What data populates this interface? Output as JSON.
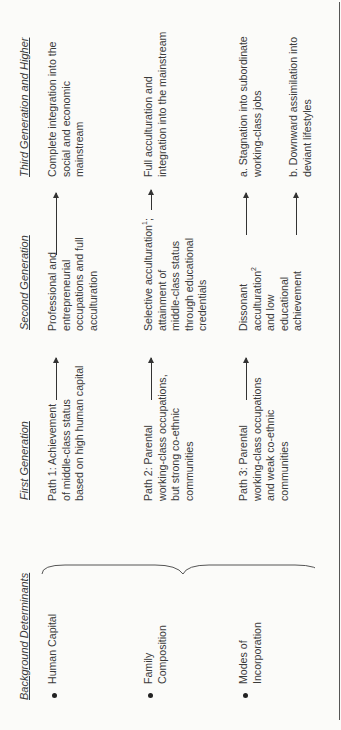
{
  "diagram": {
    "orientation": "rotated-90-counterclockwise",
    "headers": {
      "background": "Background Determinants",
      "first": "First Generation",
      "second": "Second Generation",
      "third": "Third Generation and Higher"
    },
    "determinants": [
      "Human Capital",
      "Family\nComposition",
      "Modes of\nIncorporation"
    ],
    "paths": [
      {
        "first": "Path 1:  Achievement\nof middle-class status\nbased on high human capital",
        "second": "Professional and\nentrepreneurial\noccupations and full\nacculturation",
        "third": "Complete integration into the\nsocial and economic\nmainstream"
      },
      {
        "first": "Path 2:  Parental\nworking-class occupations,\nbut strong co-ethnic\ncommunities",
        "second_pre": "Selective acculturation",
        "second_sup": "1",
        "second_post": ";\nattainment of\nmiddle-class status\nthrough educational\ncredentials",
        "third": "Full acculturation and\nintegration into the mainstream"
      },
      {
        "first": "Path 3:  Parental\nworking-class occupations\nand weak co-ethnic\ncommunities",
        "second_pre": "Dissonant\nacculturation",
        "second_sup": "2",
        "second_post": "\nand low\neducational\nachievement",
        "third_a": "a.  Stagnation into subordinate\n     working-class jobs",
        "third_b": "b.  Downward assimilation into\n     deviant lifestyles"
      }
    ]
  }
}
